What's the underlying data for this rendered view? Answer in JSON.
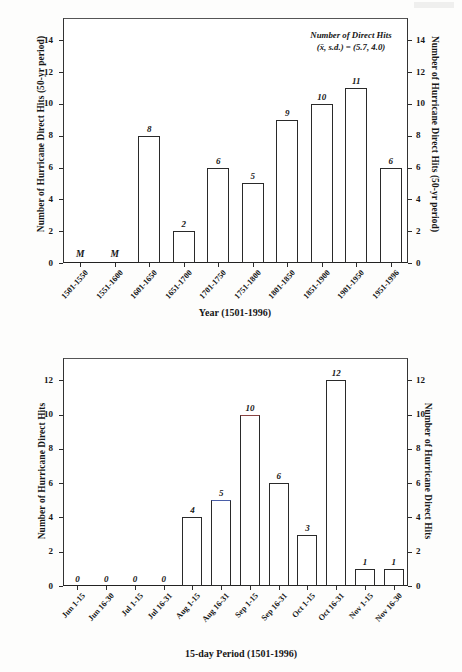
{
  "chart_data": [
    {
      "id": "top",
      "type": "bar",
      "title": "",
      "xlabel": "Year (1501-1996)",
      "ylabel": "Number of  Hurricane Direct Hits (50-yr period)",
      "ylabel_right": "Number of  Hurricane Direct Hits (50-yr period)",
      "categories": [
        "1501-1550",
        "1551-1600",
        "1601-1650",
        "1651-1700",
        "1701-1750",
        "1751-1800",
        "1801-1850",
        "1851-1900",
        "1901-1950",
        "1951-1996"
      ],
      "values": [
        null,
        null,
        8,
        2,
        6,
        5,
        9,
        10,
        11,
        6
      ],
      "point_labels": [
        "M",
        "M",
        "8",
        "2",
        "6",
        "5",
        "9",
        "10",
        "11",
        "6"
      ],
      "missing_marker": "M",
      "ylim": [
        0,
        15.4
      ],
      "yticks": [
        0,
        2,
        4,
        6,
        8,
        10,
        12,
        14
      ],
      "ytick_labels": [
        "0",
        "2",
        "4",
        "6",
        "8",
        "10",
        "12",
        "14"
      ],
      "grid": false,
      "annotation": {
        "line1": "Number of Direct Hits",
        "line2": "(x̄, s.d.) = (5.7, 4.0)"
      }
    },
    {
      "id": "bottom",
      "type": "bar",
      "title": "",
      "xlabel": "15-day Period (1501-1996)",
      "ylabel": "Number of Hurricane Direct Hits",
      "ylabel_right": "Number of Hurricane Direct Hits",
      "categories": [
        "Jun 1-15",
        "Jun 16-30",
        "Jul 1-15",
        "Jul 16-31",
        "Aug 1-15",
        "Aug 16-31",
        "Sep 1-15",
        "Sep 16-31",
        "Oct 1-15",
        "Oct 16-31",
        "Nov 1-15",
        "Nov 16-30"
      ],
      "values": [
        0,
        0,
        0,
        0,
        4,
        5,
        10,
        6,
        3,
        12,
        1,
        1
      ],
      "point_labels": [
        "0",
        "0",
        "0",
        "0",
        "4",
        "5",
        "10",
        "6",
        "3",
        "12",
        "1",
        "1"
      ],
      "ylim": [
        0,
        13.3
      ],
      "yticks": [
        0,
        2,
        4,
        6,
        8,
        10,
        12
      ],
      "ytick_labels": [
        "0",
        "2",
        "4",
        "6",
        "8",
        "10",
        "12"
      ],
      "grid": false,
      "annotation": null
    }
  ],
  "colors": {
    "axis": "#2a2a2a",
    "bar_fill": "#ffffff",
    "bar_edge": "#2a2a2a",
    "text": "#161616",
    "page": "#fdfdfc"
  }
}
